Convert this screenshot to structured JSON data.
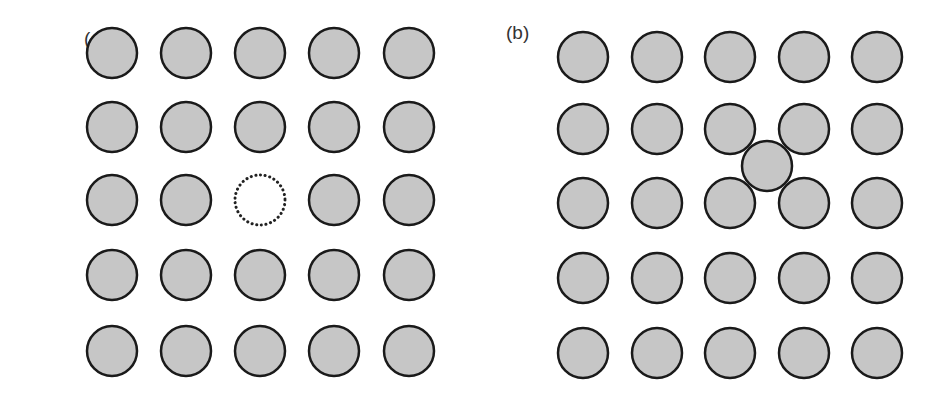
{
  "figure": {
    "panels": [
      {
        "label": "(a)",
        "description": "Square lattice with vacancy",
        "cols_x": [
          112,
          186,
          260,
          334,
          409
        ],
        "rows_y": [
          53,
          127,
          200,
          275,
          351
        ],
        "vacancy": {
          "col": 2,
          "row": 2
        }
      },
      {
        "label": "(b)",
        "description": "Square lattice with interstitial",
        "cols_x": [
          583,
          657,
          730,
          804,
          877
        ],
        "rows_y": [
          57,
          129,
          203,
          278,
          353
        ],
        "interstitial": {
          "x": 767,
          "y": 166
        }
      }
    ],
    "atom_radius": 25,
    "colors": {
      "atom_fill": "#c6c6c6",
      "atom_stroke": "#1a1a1a",
      "vacancy_stroke": "#222222",
      "background": "#ffffff"
    }
  }
}
